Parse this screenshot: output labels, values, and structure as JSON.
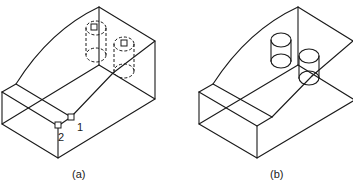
{
  "figure": {
    "panels": [
      {
        "id": "a",
        "caption": "(a)",
        "description": "Wireframe block with curved ramp, dashed hidden cylinders, picked points",
        "points": [
          {
            "label": "1"
          },
          {
            "label": "2"
          }
        ],
        "cylinders": 2,
        "cylinder_style": "dashed"
      },
      {
        "id": "b",
        "caption": "(b)",
        "description": "Same wireframe block with solid cylinders placed on surface",
        "cylinders": 2,
        "cylinder_style": "solid"
      }
    ]
  }
}
